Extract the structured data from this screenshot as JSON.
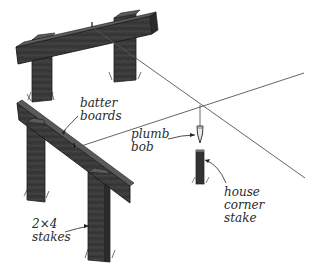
{
  "diagram": {
    "labels": {
      "batter_boards": [
        "batter",
        "boards"
      ],
      "plumb_bob": [
        "plumb",
        "bob"
      ],
      "house_corner_stake": [
        "house",
        "corner",
        "stake"
      ],
      "stakes": [
        "2×4",
        "stakes"
      ]
    },
    "colors": {
      "wood": "#3a3a3a",
      "wood_dark": "#222222",
      "wood_light": "#5a5a5a",
      "string": "#555555",
      "text": "#2a2a2a",
      "background": "#ffffff"
    }
  }
}
